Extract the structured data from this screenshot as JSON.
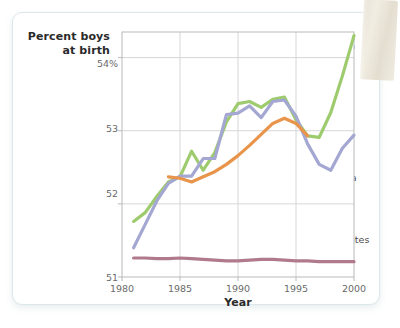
{
  "card": {
    "tape_name": "tape-strip"
  },
  "chart_data": {
    "type": "line",
    "title": "",
    "xlabel": "Year",
    "ylabel": "Percent boys\nat birth",
    "ylabel_line1": "Percent boys",
    "ylabel_line2": "at birth",
    "xlim": [
      1980,
      2000
    ],
    "ylim": [
      51,
      54.35
    ],
    "xticks": [
      "1980",
      "1985",
      "1990",
      "1995",
      "2000"
    ],
    "xtick_values": [
      1980,
      1985,
      1990,
      1995,
      2000
    ],
    "yticks": [
      "51",
      "52",
      "53",
      "54%"
    ],
    "ytick_values": [
      51,
      52,
      53,
      54
    ],
    "grid": true,
    "legend_position": "inline-annotations",
    "colors": {
      "china": "#9ecb6e",
      "south_korea": "#a3a7d1",
      "india": "#e8944a",
      "united_states": "#b07a8c",
      "grid": "#d6d6d6",
      "frame": "#b9b9b9",
      "tick_text": "#6a6a6a",
      "axis_title": "#2a2a2a"
    },
    "series": [
      {
        "name": "China",
        "label": "China",
        "color": "#9ecb6e",
        "x": [
          1981,
          1982,
          1983,
          1984,
          1985,
          1986,
          1987,
          1988,
          1989,
          1990,
          1991,
          1992,
          1993,
          1994,
          1995,
          1996,
          1997,
          1998,
          1999,
          2000
        ],
        "values": [
          51.76,
          51.88,
          52.1,
          52.3,
          52.37,
          52.72,
          52.46,
          52.7,
          53.12,
          53.37,
          53.4,
          53.32,
          53.43,
          53.46,
          53.15,
          52.93,
          52.91,
          53.25,
          53.75,
          54.3
        ]
      },
      {
        "name": "South Korea",
        "label": "South Korea",
        "color": "#a3a7d1",
        "x": [
          1981,
          1982,
          1983,
          1984,
          1985,
          1986,
          1987,
          1988,
          1989,
          1990,
          1991,
          1992,
          1993,
          1994,
          1995,
          1996,
          1997,
          1998,
          1999,
          2000
        ],
        "values": [
          51.4,
          51.72,
          52.04,
          52.28,
          52.38,
          52.38,
          52.62,
          52.62,
          53.22,
          53.24,
          53.34,
          53.18,
          53.4,
          53.42,
          53.2,
          52.82,
          52.54,
          52.46,
          52.76,
          52.94
        ]
      },
      {
        "name": "India",
        "label": "India",
        "color": "#e8944a",
        "x": [
          1984,
          1985,
          1986,
          1987,
          1988,
          1989,
          1990,
          1991,
          1992,
          1993,
          1994,
          1995,
          1996
        ],
        "values": [
          52.37,
          52.35,
          52.3,
          52.37,
          52.44,
          52.54,
          52.66,
          52.8,
          52.95,
          53.1,
          53.17,
          53.1,
          52.93
        ]
      },
      {
        "name": "United States",
        "label": "United States",
        "color": "#b07a8c",
        "x": [
          1981,
          1982,
          1983,
          1984,
          1985,
          1986,
          1987,
          1988,
          1989,
          1990,
          1991,
          1992,
          1993,
          1994,
          1995,
          1996,
          1997,
          1998,
          1999,
          2000
        ],
        "values": [
          51.26,
          51.26,
          51.25,
          51.25,
          51.26,
          51.25,
          51.24,
          51.23,
          51.22,
          51.22,
          51.23,
          51.24,
          51.24,
          51.23,
          51.22,
          51.22,
          51.21,
          51.21,
          51.21,
          51.21
        ]
      }
    ],
    "annotations": [
      {
        "text": "China",
        "x_px": 328,
        "y_px": 46
      },
      {
        "text": "India",
        "x_px": 313,
        "y_px": 140
      },
      {
        "text": "South Korea",
        "x_px": 300,
        "y_px": 178
      },
      {
        "text": "United States",
        "x_px": 306,
        "y_px": 240
      }
    ]
  }
}
